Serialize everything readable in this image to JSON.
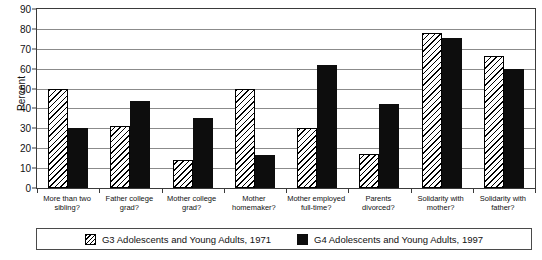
{
  "chart_data": {
    "type": "bar",
    "title": "",
    "subtitle": "",
    "xlabel": "",
    "ylabel": "Percent",
    "ylim": [
      0,
      90
    ],
    "yticks": [
      0,
      10,
      20,
      30,
      40,
      50,
      60,
      70,
      80,
      90
    ],
    "ytick_labels": [
      "0",
      "10",
      "20",
      "30",
      "40",
      "50",
      "60",
      "70",
      "80",
      "90"
    ],
    "grid": true,
    "legend_position": "bottom",
    "categories": [
      "More than two sibling?",
      "Father college grad?",
      "Mother college grad?",
      "Mother homemaker?",
      "Mother employed full-time?",
      "Parents divorced?",
      "Solidarity with mother?",
      "Solidarity with father?"
    ],
    "category_lines": [
      [
        "More than two",
        "sibling?"
      ],
      [
        "Father college",
        "grad?"
      ],
      [
        "Mother college",
        "grad?"
      ],
      [
        "Mother",
        "homemaker?"
      ],
      [
        "Mother employed",
        "full-time?"
      ],
      [
        "Parents",
        "divorced?"
      ],
      [
        "Solidarity with",
        "mother?"
      ],
      [
        "Solidarity with",
        "father?"
      ]
    ],
    "series": [
      {
        "name": "G3 Adolescents and Young Adults, 1971",
        "fill": "diagonal-hatch",
        "color": "#ffffff",
        "values": [
          50,
          31,
          14,
          50,
          30,
          17,
          78,
          66.5
        ]
      },
      {
        "name": "G4 Adolescents and Young Adults, 1997",
        "fill": "solid",
        "color": "#0d0d0d",
        "values": [
          30,
          43.5,
          35,
          16.5,
          62,
          42,
          75.5,
          60
        ]
      }
    ]
  },
  "legend": {
    "entries": [
      {
        "label": "G3 Adolescents and Young Adults, 1971"
      },
      {
        "label": "G4 Adolescents and Young Adults, 1997"
      }
    ]
  }
}
